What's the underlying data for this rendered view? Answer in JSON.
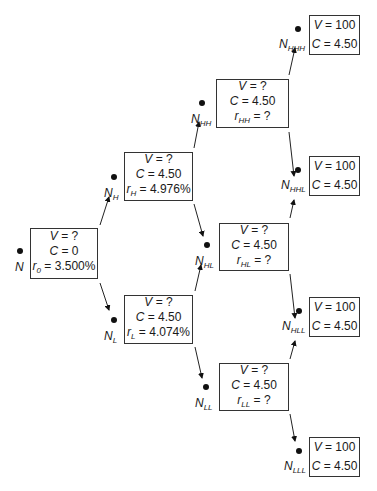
{
  "diagram": {
    "type": "binomial-interest-rate-tree",
    "nodes": [
      {
        "id": "N",
        "label": "N",
        "sub": "",
        "V": "?",
        "C": "0",
        "r_label": "r",
        "r_sub": "0",
        "r": "3.500%"
      },
      {
        "id": "N_H",
        "label": "N",
        "sub": "H",
        "V": "?",
        "C": "4.50",
        "r_label": "r",
        "r_sub": "H",
        "r": "4.976%"
      },
      {
        "id": "N_L",
        "label": "N",
        "sub": "L",
        "V": "?",
        "C": "4.50",
        "r_label": "r",
        "r_sub": "L",
        "r": "4.074%"
      },
      {
        "id": "N_HH",
        "label": "N",
        "sub": "HH",
        "V": "?",
        "C": "4.50",
        "r_label": "r",
        "r_sub": "HH",
        "r": "?"
      },
      {
        "id": "N_HL",
        "label": "N",
        "sub": "HL",
        "V": "?",
        "C": "4.50",
        "r_label": "r",
        "r_sub": "HL",
        "r": "?"
      },
      {
        "id": "N_LL",
        "label": "N",
        "sub": "LL",
        "V": "?",
        "C": "4.50",
        "r_label": "r",
        "r_sub": "LL",
        "r": "?"
      },
      {
        "id": "N_HHH",
        "label": "N",
        "sub": "HHH",
        "V": "100",
        "C": "4.50"
      },
      {
        "id": "N_HHL",
        "label": "N",
        "sub": "HHL",
        "V": "100",
        "C": "4.50"
      },
      {
        "id": "N_HLL",
        "label": "N",
        "sub": "HLL",
        "V": "100",
        "C": "4.50"
      },
      {
        "id": "N_LLL",
        "label": "N",
        "sub": "LLL",
        "V": "100",
        "C": "4.50"
      }
    ],
    "edges": [
      [
        "N",
        "N_H"
      ],
      [
        "N",
        "N_L"
      ],
      [
        "N_H",
        "N_HH"
      ],
      [
        "N_H",
        "N_HL"
      ],
      [
        "N_L",
        "N_HL"
      ],
      [
        "N_L",
        "N_LL"
      ],
      [
        "N_HH",
        "N_HHH"
      ],
      [
        "N_HH",
        "N_HHL"
      ],
      [
        "N_HL",
        "N_HHL"
      ],
      [
        "N_HL",
        "N_HLL"
      ],
      [
        "N_LL",
        "N_HLL"
      ],
      [
        "N_LL",
        "N_LLL"
      ]
    ],
    "symbols": {
      "value": "V",
      "coupon": "C",
      "equals": " = "
    }
  }
}
